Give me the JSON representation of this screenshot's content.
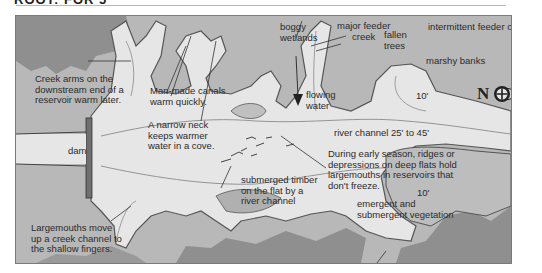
{
  "header": {
    "title_cropped": "ROOT: FOR 5"
  },
  "map": {
    "colors": {
      "land_dark": "#8f8f8f",
      "land_mid": "#a9a9a9",
      "land_light": "#bdbdbd",
      "water": "#e6e6e6",
      "shoreline": "#555555",
      "contour": "#8a8a8a",
      "dam": "#6f6f6f",
      "text": "#2b2b2b"
    },
    "labels": {
      "creek_arms": [
        "Creek arms on the",
        "downstream end of a",
        "reservoir warm later."
      ],
      "man_made_canals": [
        "Man-made canals",
        "warm quickly."
      ],
      "boggy_wetlands": [
        "boggy",
        "wetlands"
      ],
      "major_feeder_creek": [
        "major feeder",
        "creek"
      ],
      "fallen_trees": [
        "fallen",
        "trees"
      ],
      "intermittent_feeder_creek": "intermittent feeder creek",
      "marshy_banks": "marshy banks",
      "narrow_neck": [
        "A narrow neck",
        "keeps warmer",
        "water in a cove."
      ],
      "flowing_water": [
        "flowing",
        "water"
      ],
      "depth_10_upper": "10'",
      "depth_10_lower": "10'",
      "river_channel": "river channel 25' to 45'",
      "dam": "dam",
      "early_season": [
        "During early season, ridges or",
        "depressions on deep flats hold",
        "largemouths in reservoirs that",
        "don't freeze."
      ],
      "submerged_timber": [
        "submerged timber",
        "on the flat by a",
        "river channel"
      ],
      "largemouths_move": [
        "Largemouths move",
        "up a creek channel to",
        "the shallow fingers."
      ],
      "vegetation": [
        "emergent and",
        "submergent vegetation"
      ]
    },
    "compass": {
      "letter": "N",
      "icon": "compass-arrow-icon",
      "direction": "points right"
    }
  }
}
